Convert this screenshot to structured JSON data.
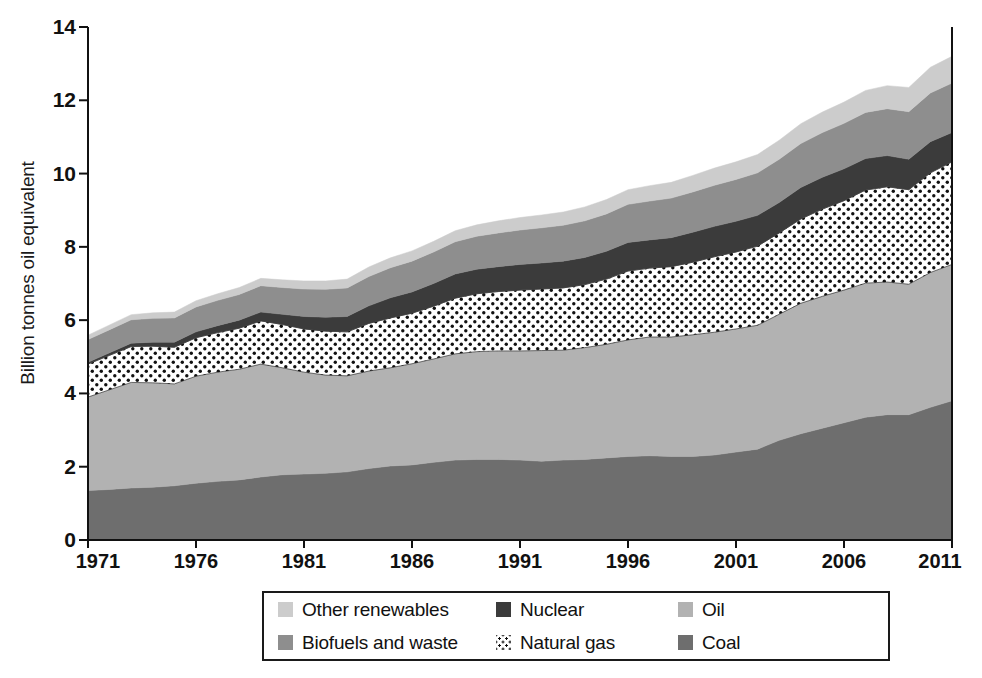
{
  "chart_data": {
    "type": "area",
    "title": "",
    "subtitle": "",
    "xlabel": "",
    "ylabel": "Billion tonnes oil equivalent",
    "xlim": [
      1971,
      2011
    ],
    "ylim": [
      0,
      14
    ],
    "ytick_labels": [
      "0",
      "2",
      "4",
      "6",
      "8",
      "10",
      "12",
      "14"
    ],
    "ytick_values": [
      0,
      2,
      4,
      6,
      8,
      10,
      12,
      14
    ],
    "xtick_labels": [
      "1971",
      "1976",
      "1981",
      "1986",
      "1991",
      "1996",
      "2001",
      "2006",
      "2011"
    ],
    "xtick_values": [
      1971,
      1976,
      1981,
      1986,
      1991,
      1996,
      2001,
      2006,
      2011
    ],
    "grid": false,
    "stacked": true,
    "legend_position": "bottom",
    "x": [
      1971,
      1972,
      1973,
      1974,
      1975,
      1976,
      1977,
      1978,
      1979,
      1980,
      1981,
      1982,
      1983,
      1984,
      1985,
      1986,
      1987,
      1988,
      1989,
      1990,
      1991,
      1992,
      1993,
      1994,
      1995,
      1996,
      1997,
      1998,
      1999,
      2000,
      2001,
      2002,
      2003,
      2004,
      2005,
      2006,
      2007,
      2008,
      2009,
      2010,
      2011
    ],
    "series": [
      {
        "name": "Coal",
        "color": "#6e6e6e",
        "pattern": "solid",
        "values": [
          1.35,
          1.38,
          1.42,
          1.44,
          1.48,
          1.55,
          1.6,
          1.64,
          1.72,
          1.78,
          1.8,
          1.82,
          1.86,
          1.95,
          2.02,
          2.05,
          2.12,
          2.18,
          2.2,
          2.2,
          2.18,
          2.15,
          2.18,
          2.2,
          2.24,
          2.28,
          2.3,
          2.28,
          2.28,
          2.32,
          2.4,
          2.48,
          2.72,
          2.9,
          3.05,
          3.2,
          3.35,
          3.42,
          3.42,
          3.62,
          3.8
        ]
      },
      {
        "name": "Oil",
        "color": "#b2b2b2",
        "pattern": "solid",
        "values": [
          2.55,
          2.72,
          2.88,
          2.85,
          2.78,
          2.92,
          2.98,
          3.02,
          3.08,
          2.92,
          2.78,
          2.68,
          2.62,
          2.66,
          2.68,
          2.76,
          2.82,
          2.9,
          2.94,
          2.96,
          2.98,
          3.02,
          3.0,
          3.05,
          3.1,
          3.18,
          3.24,
          3.26,
          3.32,
          3.35,
          3.36,
          3.38,
          3.44,
          3.56,
          3.6,
          3.62,
          3.66,
          3.62,
          3.56,
          3.68,
          3.72
        ]
      },
      {
        "name": "Natural gas",
        "color": "#ffffff",
        "pattern": "dots",
        "values": [
          0.9,
          0.94,
          0.98,
          1.0,
          1.0,
          1.05,
          1.08,
          1.12,
          1.18,
          1.18,
          1.18,
          1.2,
          1.2,
          1.3,
          1.36,
          1.38,
          1.44,
          1.52,
          1.58,
          1.62,
          1.66,
          1.68,
          1.7,
          1.72,
          1.78,
          1.88,
          1.88,
          1.92,
          1.98,
          2.06,
          2.1,
          2.16,
          2.22,
          2.3,
          2.38,
          2.44,
          2.54,
          2.6,
          2.58,
          2.72,
          2.8
        ]
      },
      {
        "name": "Nuclear",
        "color": "#3b3b3b",
        "pattern": "solid",
        "values": [
          0.05,
          0.07,
          0.09,
          0.11,
          0.14,
          0.16,
          0.19,
          0.22,
          0.24,
          0.28,
          0.34,
          0.38,
          0.42,
          0.48,
          0.55,
          0.58,
          0.62,
          0.66,
          0.67,
          0.68,
          0.7,
          0.71,
          0.73,
          0.74,
          0.76,
          0.78,
          0.77,
          0.79,
          0.82,
          0.83,
          0.84,
          0.84,
          0.83,
          0.86,
          0.87,
          0.87,
          0.86,
          0.85,
          0.83,
          0.85,
          0.8
        ]
      },
      {
        "name": "Biofuels and waste",
        "color": "#8e8e8e",
        "pattern": "solid",
        "values": [
          0.62,
          0.63,
          0.64,
          0.65,
          0.66,
          0.68,
          0.69,
          0.7,
          0.72,
          0.73,
          0.75,
          0.76,
          0.78,
          0.8,
          0.82,
          0.84,
          0.86,
          0.88,
          0.9,
          0.92,
          0.94,
          0.96,
          0.98,
          1.0,
          1.02,
          1.04,
          1.06,
          1.08,
          1.1,
          1.12,
          1.14,
          1.16,
          1.18,
          1.2,
          1.22,
          1.24,
          1.26,
          1.28,
          1.3,
          1.33,
          1.35
        ]
      },
      {
        "name": "Other renewables",
        "color": "#cccccc",
        "pattern": "solid",
        "values": [
          0.12,
          0.13,
          0.14,
          0.15,
          0.16,
          0.17,
          0.18,
          0.19,
          0.2,
          0.21,
          0.22,
          0.23,
          0.24,
          0.26,
          0.27,
          0.28,
          0.29,
          0.3,
          0.31,
          0.33,
          0.34,
          0.35,
          0.36,
          0.38,
          0.39,
          0.4,
          0.42,
          0.43,
          0.45,
          0.47,
          0.48,
          0.5,
          0.52,
          0.54,
          0.56,
          0.58,
          0.6,
          0.63,
          0.66,
          0.7,
          0.73
        ]
      }
    ]
  },
  "legend": {
    "items": [
      {
        "label": "Other renewables",
        "color": "#cccccc",
        "pattern": "solid"
      },
      {
        "label": "Nuclear",
        "color": "#3b3b3b",
        "pattern": "solid"
      },
      {
        "label": "Oil",
        "color": "#b2b2b2",
        "pattern": "solid"
      },
      {
        "label": "Biofuels and waste",
        "color": "#8e8e8e",
        "pattern": "solid"
      },
      {
        "label": "Natural gas",
        "color": "#ffffff",
        "pattern": "dots"
      },
      {
        "label": "Coal",
        "color": "#6e6e6e",
        "pattern": "solid"
      }
    ]
  },
  "axes": {
    "ylabel": "Billion tonnes oil equivalent"
  }
}
